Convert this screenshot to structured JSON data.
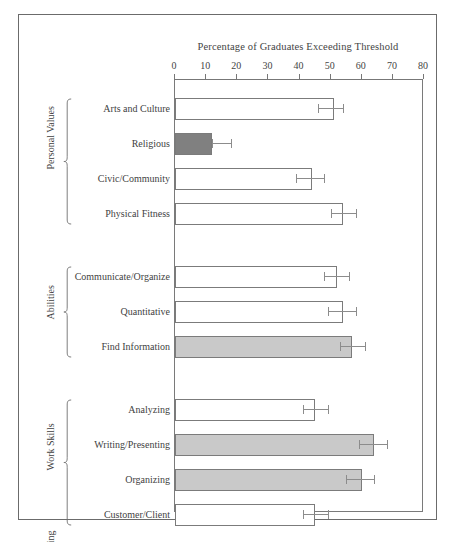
{
  "chart_data": {
    "type": "bar",
    "orientation": "horizontal",
    "title": "Percentage of Graduates Exceeding Threshold",
    "xlabel": "",
    "ylabel": "",
    "xlim": [
      0,
      80
    ],
    "xticks": [
      0,
      10,
      20,
      30,
      40,
      50,
      60,
      70,
      80
    ],
    "xtick_labels": [
      "0",
      "10",
      "20",
      "30",
      "40",
      "50",
      "60",
      "70",
      "80"
    ],
    "grid": false,
    "legend": "none",
    "groups": [
      {
        "name": "Personal Values",
        "items": [
          {
            "label": "Arts and Culture",
            "value": 51,
            "err_low": 46,
            "err_high": 54,
            "fill": "white"
          },
          {
            "label": "Religious",
            "value": 12,
            "err_low": 12,
            "err_high": 18,
            "fill": "darkgray"
          },
          {
            "label": "Civic/Community",
            "value": 44,
            "err_low": 39,
            "err_high": 48,
            "fill": "white"
          },
          {
            "label": "Physical Fitness",
            "value": 54,
            "err_low": 50,
            "err_high": 58,
            "fill": "white"
          }
        ]
      },
      {
        "name": "Abilities",
        "items": [
          {
            "label": "Communicate/Organize",
            "value": 52,
            "err_low": 48,
            "err_high": 56,
            "fill": "white"
          },
          {
            "label": "Quantitative",
            "value": 54,
            "err_low": 49,
            "err_high": 58,
            "fill": "white"
          },
          {
            "label": "Find Information",
            "value": 57,
            "err_low": 53,
            "err_high": 61,
            "fill": "lightgray"
          }
        ]
      },
      {
        "name": "Work Skills",
        "items": [
          {
            "label": "Analyzing",
            "value": 45,
            "err_low": 41,
            "err_high": 49,
            "fill": "white"
          },
          {
            "label": "Writing/Presenting",
            "value": 64,
            "err_low": 59,
            "err_high": 68,
            "fill": "lightgray"
          },
          {
            "label": "Organizing",
            "value": 60,
            "err_low": 55,
            "err_high": 64,
            "fill": "lightgray"
          },
          {
            "label": "Customer/Client",
            "value": 45,
            "err_low": 41,
            "err_high": 49,
            "fill": "white"
          }
        ]
      },
      {
        "name": "Lifelong Learning",
        "items": [
          {
            "label": "Keep Informed",
            "value": 56,
            "err_low": 51,
            "err_high": 60,
            "fill": "white"
          },
          {
            "label": "Like to Learn",
            "value": 64,
            "err_low": 59,
            "err_high": 68,
            "fill": "lightgray"
          }
        ]
      }
    ],
    "colors": {
      "white": "#ffffff",
      "lightgray": "#c9c9c9",
      "darkgray": "#808080",
      "bar_edge": "#7b7b7b",
      "error_bar": "#8c8c8c",
      "axis": "#777777",
      "text": "#3f3f3f"
    }
  }
}
